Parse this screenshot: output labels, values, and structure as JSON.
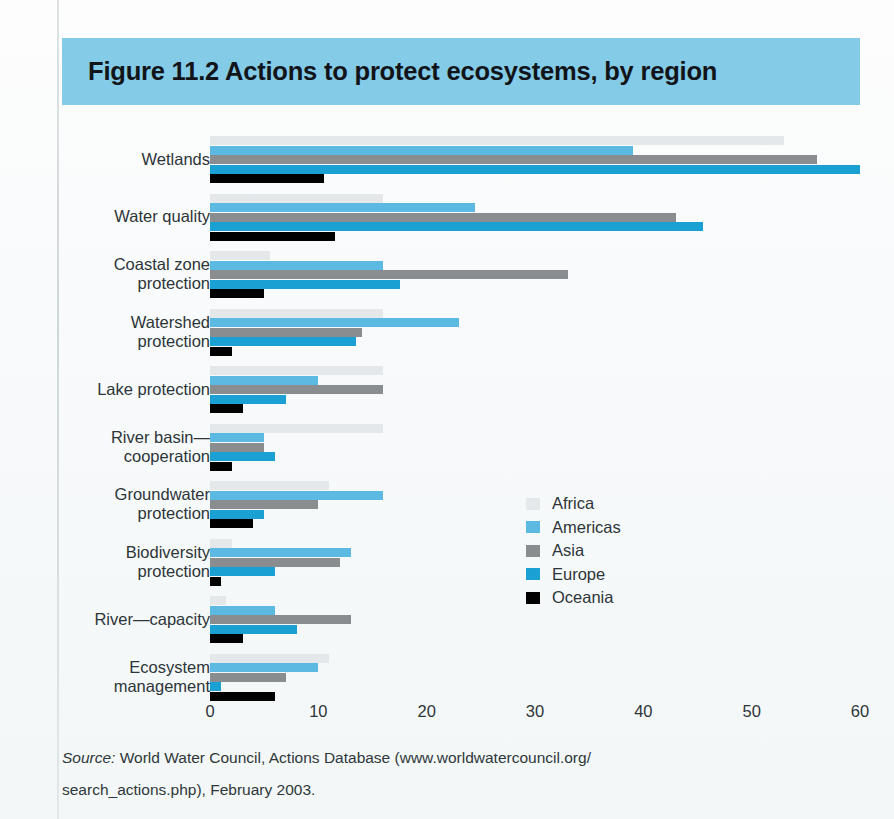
{
  "figure": {
    "title": "Figure 11.2  Actions to protect ecosystems, by region",
    "title_band_color": "#84cbe8"
  },
  "source": {
    "label": "Source:",
    "line1_rest": " World Water Council, Actions Database (www.worldwatercouncil.org/",
    "line2": "search_actions.php), February 2003."
  },
  "legend": {
    "position": "inside-right",
    "items": [
      {
        "label": "Africa",
        "color": "#e4e8ea"
      },
      {
        "label": "Americas",
        "color": "#5bb9e2"
      },
      {
        "label": "Asia",
        "color": "#8a8d8f"
      },
      {
        "label": "Europe",
        "color": "#1ba0d4"
      },
      {
        "label": "Oceania",
        "color": "#000000"
      }
    ]
  },
  "chart_data": {
    "type": "bar",
    "orientation": "horizontal",
    "title": "Figure 11.2  Actions to protect ecosystems, by region",
    "xlabel": "",
    "ylabel": "",
    "xlim": [
      0,
      60
    ],
    "xticks": [
      0,
      10,
      20,
      30,
      40,
      50,
      60
    ],
    "grid": false,
    "categories": [
      "Wetlands",
      "Water quality",
      "Coastal zone protection",
      "Watershed protection",
      "Lake protection",
      "River basin—cooperation",
      "Groundwater protection",
      "Biodiversity protection",
      "River—capacity",
      "Ecosystem management"
    ],
    "category_lines": [
      [
        "Wetlands"
      ],
      [
        "Water quality"
      ],
      [
        "Coastal zone",
        "protection"
      ],
      [
        "Watershed",
        "protection"
      ],
      [
        "Lake protection"
      ],
      [
        "River basin—",
        "cooperation"
      ],
      [
        "Groundwater",
        "protection"
      ],
      [
        "Biodiversity",
        "protection"
      ],
      [
        "River—capacity"
      ],
      [
        "Ecosystem",
        "management"
      ]
    ],
    "series": [
      {
        "name": "Africa",
        "color": "#e4e8ea",
        "values": [
          53,
          16,
          5.5,
          16,
          16,
          16,
          11,
          2,
          1.5,
          11
        ]
      },
      {
        "name": "Americas",
        "color": "#5bb9e2",
        "values": [
          39,
          24.5,
          16,
          23,
          10,
          5,
          16,
          13,
          6,
          10
        ]
      },
      {
        "name": "Asia",
        "color": "#8a8d8f",
        "values": [
          56,
          43,
          33,
          14,
          16,
          5,
          10,
          12,
          13,
          7
        ]
      },
      {
        "name": "Europe",
        "color": "#1ba0d4",
        "values": [
          60,
          45.5,
          17.5,
          13.5,
          7,
          6,
          5,
          6,
          8,
          1
        ]
      },
      {
        "name": "Oceania",
        "color": "#000000",
        "values": [
          10.5,
          11.5,
          5,
          2,
          3,
          2,
          4,
          1,
          3,
          6
        ]
      }
    ]
  }
}
